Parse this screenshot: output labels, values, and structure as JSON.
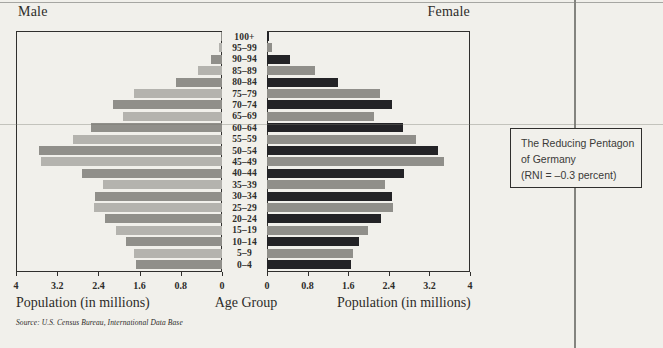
{
  "page": {
    "background": "#f1f0eb"
  },
  "chart_data": {
    "type": "bar",
    "variant": "population-pyramid",
    "title_left": "Male",
    "title_right": "Female",
    "categories": [
      "100+",
      "95–99",
      "90–94",
      "85–89",
      "80–84",
      "75–79",
      "70–74",
      "65–69",
      "60–64",
      "55–59",
      "50–54",
      "45–49",
      "40–44",
      "35–39",
      "30–34",
      "25–29",
      "20–24",
      "15–19",
      "10–14",
      "5–9",
      "0–4"
    ],
    "series": [
      {
        "name": "Male",
        "values": [
          0.02,
          0.05,
          0.22,
          0.46,
          0.9,
          1.71,
          2.12,
          1.92,
          2.54,
          2.89,
          3.55,
          3.52,
          2.71,
          2.32,
          2.46,
          2.49,
          2.28,
          2.05,
          1.86,
          1.71,
          1.68
        ]
      },
      {
        "name": "Female",
        "values": [
          0.03,
          0.1,
          0.46,
          0.95,
          1.4,
          2.22,
          2.47,
          2.1,
          2.67,
          2.93,
          3.37,
          3.49,
          2.7,
          2.32,
          2.46,
          2.48,
          2.25,
          1.99,
          1.81,
          1.69,
          1.66
        ]
      }
    ],
    "xlim": [
      0,
      4
    ],
    "ticks_left": [
      "4",
      "3.2",
      "2.4",
      "1.6",
      "0.8",
      "0"
    ],
    "ticks_right": [
      "0",
      "0.8",
      "1.6",
      "2.4",
      "3.2",
      "4"
    ],
    "xlabel_left": "Population (in millions)",
    "xlabel_center": "Age Group",
    "xlabel_right": "Population (in millions)",
    "grid": "off",
    "legend": "none",
    "colors": {
      "paper": "#f1f0eb",
      "male_strong": "#908f8a",
      "male_weak": "#b4b3ae",
      "female_strong": "#232326",
      "female_weak": "#908f8a",
      "border": "#302f2d"
    }
  },
  "annotation": {
    "lines": [
      "The Reducing Pentagon",
      "of Germany",
      "(RNI = –0.3 percent)"
    ]
  },
  "source": "Source: U.S. Census Bureau, International Data Base"
}
